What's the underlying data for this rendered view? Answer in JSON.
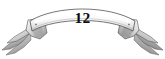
{
  "figure": {
    "name": "decorative-ribbon-banner",
    "kind": "ornamental-scroll-banner",
    "background_color": "#ffffff"
  },
  "banner": {
    "number_label": "12",
    "number_color": "#0d0d0d",
    "scroll_fill_light": "#ffffff",
    "scroll_fill_mid": "#e9e9e9",
    "scroll_fill_shadow": "#b9b9b9",
    "outline_color": "#4a4a4a",
    "eyelet_color": "#5a5a5a"
  },
  "tails": {
    "left_label": "left-ribbon-tail",
    "right_label": "right-ribbon-tail",
    "fold_fill_dark": "#8d8d8d",
    "fold_fill_darker": "#6b6b6b",
    "fold_fill_light": "#f2f2f2"
  }
}
